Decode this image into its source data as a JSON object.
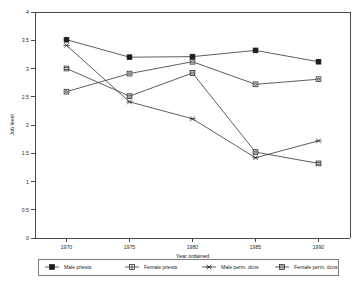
{
  "chart_data": {
    "type": "line",
    "title": "",
    "xlabel": "Year ordained",
    "ylabel": "Job level",
    "x": [
      1970,
      1975,
      1980,
      1985,
      1990
    ],
    "xtick_labels": [
      "1970",
      "1975",
      "1980",
      "1985",
      "1990"
    ],
    "ytick_labels": [
      "0",
      "0.5",
      "1",
      "1.5",
      "2",
      "2.5",
      "3",
      "3.5",
      "4"
    ],
    "ytick_values": [
      0,
      0.5,
      1,
      1.5,
      2,
      2.5,
      3,
      3.5,
      4
    ],
    "xlim": [
      1967.5,
      1992.5
    ],
    "ylim": [
      0,
      4
    ],
    "grid": false,
    "legend_position": "bottom",
    "series": [
      {
        "name": "Male priests",
        "marker": "filled-square",
        "values": [
          3.51,
          3.2,
          3.21,
          3.32,
          3.12
        ]
      },
      {
        "name": "Female priests",
        "marker": "open-square",
        "values": [
          2.59,
          2.91,
          3.12,
          2.72,
          2.81
        ]
      },
      {
        "name": "Male perm. dcns",
        "marker": "cross-x",
        "values": [
          3.41,
          2.41,
          2.11,
          1.42,
          1.72
        ]
      },
      {
        "name": "Female perm. dcns",
        "marker": "barred-square",
        "values": [
          3.0,
          2.51,
          2.92,
          1.52,
          1.32
        ]
      }
    ]
  },
  "colors": {
    "line": "#2a2a2a",
    "axis": "#4a4a4a",
    "text": "#1a1a1a",
    "background": "#ffffff"
  }
}
